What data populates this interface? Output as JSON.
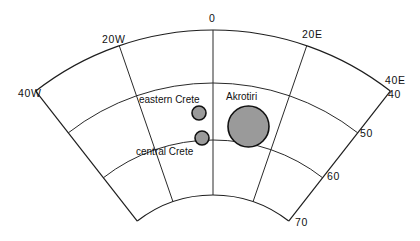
{
  "map": {
    "projection": "conic fan",
    "longitude_labels": [
      {
        "text": "40W",
        "x": 18,
        "y": 97
      },
      {
        "text": "20W",
        "x": 102,
        "y": 43
      },
      {
        "text": "0",
        "x": 209,
        "y": 22
      },
      {
        "text": "20E",
        "x": 302,
        "y": 38
      },
      {
        "text": "40E",
        "x": 385,
        "y": 84
      }
    ],
    "latitude_labels": [
      {
        "text": "40",
        "x": 388,
        "y": 98
      },
      {
        "text": "50",
        "x": 360,
        "y": 137
      },
      {
        "text": "60",
        "x": 327,
        "y": 180
      },
      {
        "text": "70",
        "x": 295,
        "y": 226
      }
    ],
    "sites": [
      {
        "name": "eastern Crete",
        "label_x": 139,
        "label_y": 103,
        "cx": 199,
        "cy": 113,
        "r": 7
      },
      {
        "name": "central Crete",
        "label_x": 136,
        "label_y": 155,
        "cx": 202,
        "cy": 138,
        "r": 7
      },
      {
        "name": "Akrotiri",
        "label_x": 226,
        "label_y": 100,
        "cx": 248.5,
        "cy": 126.5,
        "r": 20.5
      }
    ],
    "colors": {
      "line": "#2a2a2a",
      "site_fill": "#9a9a9a",
      "site_stroke": "#111111"
    }
  }
}
